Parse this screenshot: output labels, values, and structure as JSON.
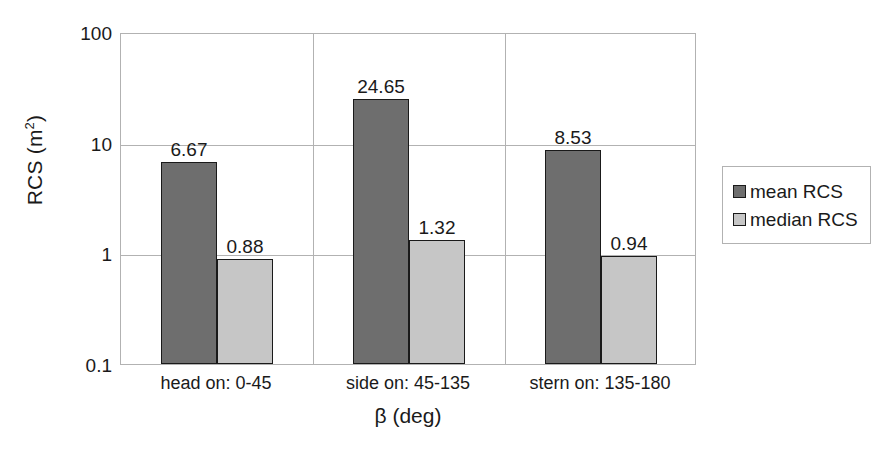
{
  "chart_data": {
    "type": "bar",
    "title": "",
    "xlabel": "β (deg)",
    "ylabel": "RCS (m²)",
    "ylabel_base": "RCS (m",
    "ylabel_sup": "2",
    "ylabel_tail": ")",
    "yscale": "log",
    "ylim": [
      0.1,
      100
    ],
    "ytick_labels": [
      "100",
      "10",
      "1",
      "0.1"
    ],
    "ytick_values": [
      100,
      10,
      1,
      0.1
    ],
    "grid": true,
    "legend_position": "right",
    "categories": [
      "head on: 0-45",
      "side on: 45-135",
      "stern on: 135-180"
    ],
    "series": [
      {
        "name": "mean RCS",
        "color": "#6e6e6e",
        "values": [
          6.67,
          24.65,
          8.53
        ],
        "labels": [
          "6.67",
          "24.65",
          "8.53"
        ]
      },
      {
        "name": "median RCS",
        "color": "#c6c6c6",
        "values": [
          0.88,
          1.32,
          0.94
        ],
        "labels": [
          "0.88",
          "1.32",
          "0.94"
        ]
      }
    ]
  },
  "legend": {
    "entries": [
      {
        "label": "mean RCS",
        "swatch": "mean"
      },
      {
        "label": "median RCS",
        "swatch": "median"
      }
    ]
  }
}
